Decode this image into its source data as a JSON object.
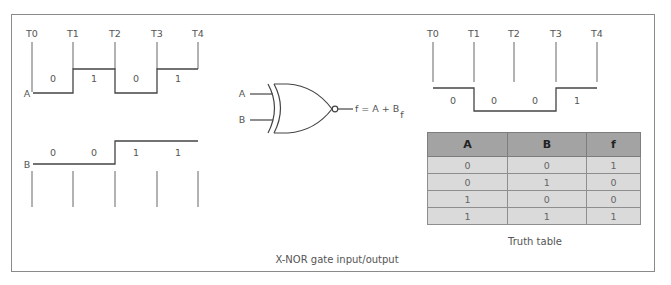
{
  "caption": "X-NOR gate input/output",
  "timeline_labels": [
    "T0",
    "T1",
    "T2",
    "T3",
    "T4"
  ],
  "signal_a": {
    "name": "A",
    "bits": [
      "0",
      "1",
      "0",
      "1"
    ]
  },
  "signal_b": {
    "name": "B",
    "bits": [
      "0",
      "0",
      "1",
      "1"
    ]
  },
  "signal_f": {
    "name": "f",
    "bits": [
      "0",
      "0",
      "0",
      "1"
    ]
  },
  "gate": {
    "type": "X-NOR",
    "input_a": "A",
    "input_b": "B",
    "output_expr": "f = A + B"
  },
  "truth_table": {
    "caption": "Truth table",
    "headers": [
      "A",
      "B",
      "f"
    ],
    "rows": [
      [
        "0",
        "0",
        "1"
      ],
      [
        "0",
        "1",
        "0"
      ],
      [
        "1",
        "0",
        "0"
      ],
      [
        "1",
        "1",
        "1"
      ]
    ]
  },
  "colors": {
    "line": "#444444",
    "tick": "#666666",
    "frame": "#8a8a8a",
    "table_header": "#a3a3a3",
    "table_row": "#dadada"
  }
}
